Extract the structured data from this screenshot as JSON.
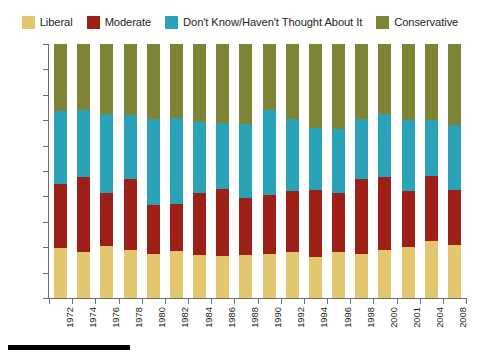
{
  "legend": {
    "items": [
      {
        "label": "Liberal",
        "color": "#e3c76f"
      },
      {
        "label": "Moderate",
        "color": "#9c1f18"
      },
      {
        "label": "Don't Know/Haven't Thought About It",
        "color": "#2aa3b8"
      },
      {
        "label": "Conservative",
        "color": "#7d8435"
      }
    ]
  },
  "chart_data": {
    "type": "bar",
    "subtype": "stacked-percent",
    "title": "",
    "xlabel": "",
    "ylabel": "",
    "ylim": [
      0,
      100
    ],
    "grid": false,
    "legend_position": "top",
    "y_ticks": [
      "0%",
      "10%",
      "20%",
      "30%",
      "40%",
      "50%",
      "60%",
      "70%",
      "80%",
      "90%",
      "100%"
    ],
    "categories": [
      "1972",
      "1974",
      "1976",
      "1978",
      "1980",
      "1982",
      "1984",
      "1986",
      "1988",
      "1990",
      "1992",
      "1994",
      "1996",
      "1998",
      "2000",
      "2001",
      "2004",
      "2008"
    ],
    "series": [
      {
        "name": "Liberal",
        "color": "#e3c76f",
        "values": [
          19.5,
          18.0,
          20.5,
          19.0,
          17.5,
          18.5,
          17.0,
          16.5,
          17.0,
          17.5,
          18.0,
          16.0,
          18.0,
          17.5,
          19.0,
          20.0,
          22.5,
          21.0
        ]
      },
      {
        "name": "Moderate",
        "color": "#9c1f18",
        "values": [
          25.5,
          29.5,
          21.0,
          28.0,
          19.0,
          18.5,
          24.5,
          26.5,
          22.5,
          23.0,
          24.0,
          26.5,
          23.5,
          29.5,
          28.5,
          22.0,
          25.5,
          21.5
        ]
      },
      {
        "name": "Don't Know/Haven't Thought About It",
        "color": "#2aa3b8",
        "values": [
          28.5,
          26.5,
          31.0,
          25.0,
          34.0,
          34.0,
          28.0,
          26.0,
          29.0,
          33.5,
          28.5,
          24.5,
          25.0,
          23.5,
          25.0,
          28.0,
          22.0,
          25.5
        ]
      },
      {
        "name": "Conservative",
        "color": "#7d8435",
        "values": [
          26.5,
          26.0,
          27.5,
          28.0,
          29.5,
          29.0,
          30.5,
          31.0,
          31.5,
          26.0,
          29.5,
          33.0,
          33.5,
          29.5,
          27.5,
          30.0,
          30.0,
          32.0
        ]
      }
    ]
  }
}
